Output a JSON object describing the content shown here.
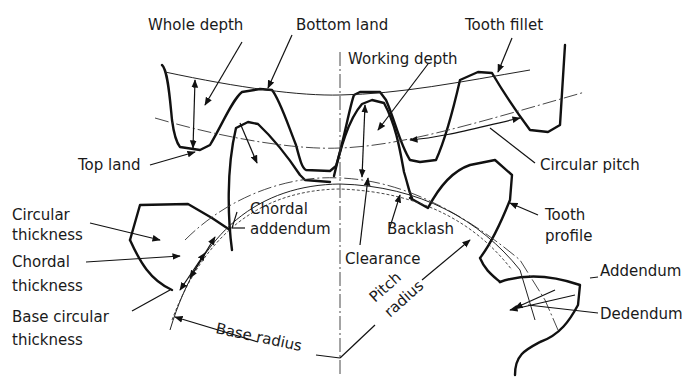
{
  "figure": {
    "labels": {
      "whole_depth": "Whole depth",
      "bottom_land": "Bottom land",
      "tooth_fillet": "Tooth fillet",
      "working_depth": "Working depth",
      "top_land": "Top land",
      "circular_pitch": "Circular pitch",
      "chordal_addendum_1": "Chordal",
      "chordal_addendum_2": "addendum",
      "circular_thickness_1": "Circular",
      "circular_thickness_2": "thickness",
      "chordal_thickness_1": "Chordal",
      "chordal_thickness_2": "thickness",
      "base_circular_thickness_1": "Base circular",
      "base_circular_thickness_2": "thickness",
      "backlash": "Backlash",
      "clearance": "Clearance",
      "tooth_profile_1": "Tooth",
      "tooth_profile_2": "profile",
      "addendum": "Addendum",
      "dedendum": "Dedendum",
      "base_radius": "Base radius",
      "pitch_radius_1": "Pitch",
      "pitch_radius_2": "radius"
    }
  }
}
